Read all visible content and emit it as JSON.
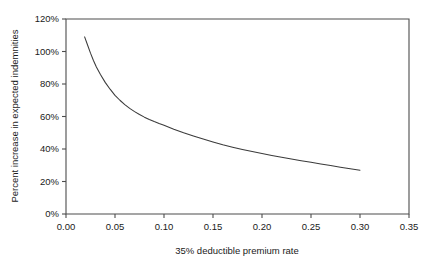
{
  "chart_data": {
    "type": "line",
    "title": "",
    "subtitle": "",
    "xlabel": "35% deductible premium rate",
    "ylabel": "Percent increase in expected indemnities",
    "xlim": [
      0.0,
      0.35
    ],
    "ylim": [
      0,
      120
    ],
    "grid": false,
    "legend": "none",
    "x_ticks": [
      "0.00",
      "0.05",
      "0.10",
      "0.15",
      "0.20",
      "0.25",
      "0.30",
      "0.35"
    ],
    "x_tick_values": [
      0.0,
      0.05,
      0.1,
      0.15,
      0.2,
      0.25,
      0.3,
      0.35
    ],
    "y_ticks": [
      "0%",
      "20%",
      "40%",
      "60%",
      "80%",
      "100%",
      "120%"
    ],
    "y_tick_values": [
      0,
      20,
      40,
      60,
      80,
      100,
      120
    ],
    "series": [
      {
        "name": "Percent increase in expected indemnities",
        "color": "#3a3a3a",
        "x": [
          0.019,
          0.022,
          0.025,
          0.028,
          0.031,
          0.035,
          0.04,
          0.045,
          0.05,
          0.055,
          0.06,
          0.065,
          0.07,
          0.075,
          0.08,
          0.085,
          0.09,
          0.095,
          0.1,
          0.11,
          0.12,
          0.13,
          0.14,
          0.15,
          0.16,
          0.17,
          0.18,
          0.19,
          0.2,
          0.21,
          0.22,
          0.23,
          0.24,
          0.25,
          0.26,
          0.27,
          0.28,
          0.29,
          0.3
        ],
        "y": [
          109.0,
          104.0,
          99.0,
          94.5,
          90.5,
          86.0,
          81.0,
          76.8,
          73.0,
          70.0,
          67.3,
          65.0,
          63.0,
          61.2,
          59.6,
          58.2,
          56.9,
          55.7,
          54.6,
          52.2,
          50.0,
          48.0,
          46.1,
          44.3,
          42.6,
          41.1,
          39.7,
          38.4,
          37.2,
          36.0,
          34.9,
          33.8,
          32.8,
          31.8,
          30.8,
          29.8,
          28.8,
          27.8,
          26.9
        ]
      }
    ]
  }
}
